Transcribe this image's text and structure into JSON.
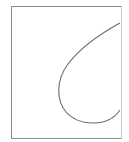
{
  "diagram": {
    "type": "curve-in-frame",
    "canvas": {
      "width": 129,
      "height": 142,
      "background": "#ffffff"
    },
    "frame": {
      "x": 11,
      "y": 6,
      "width": 110,
      "height": 132,
      "stroke": "#8a8a8a",
      "right_edge_stroke": "#b9cfe0"
    },
    "curve": {
      "stroke": "#6e6e6e",
      "path": "M 120 23 C 100 34, 80 48, 68 64 C 56 80, 56 100, 66 112 C 78 126, 108 128, 120 110",
      "points_description": "enters right edge at (120,23), vertex near (58,88), bottom near (92,124), exits right edge at (120,110)"
    }
  }
}
